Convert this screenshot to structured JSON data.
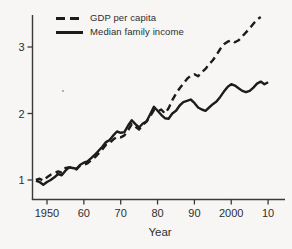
{
  "figure": {
    "background": "#f7f6f4",
    "axis_color": "#3a3a3a",
    "text_color": "#2e2e2e",
    "line_color": "#1c1c1c",
    "xlabel": "Year"
  },
  "legend": {
    "items": [
      {
        "label": "GDP per capita",
        "style": "dashed"
      },
      {
        "label": "Median family income",
        "style": "solid"
      }
    ]
  },
  "chart_data": {
    "type": "line",
    "title": "",
    "xlabel": "Year",
    "ylabel": "",
    "grid": false,
    "legend_position": "top-left",
    "ylim": [
      0.7,
      3.5
    ],
    "y_ticks": [
      1,
      2,
      3
    ],
    "y_tick_labels": [
      "1",
      "2",
      "3"
    ],
    "x_ticks": [
      1950,
      1960,
      1970,
      1980,
      1990,
      2000,
      2010
    ],
    "x_tick_labels": [
      "1950",
      "60",
      "70",
      "80",
      "90",
      "2000",
      "10"
    ],
    "series": [
      {
        "name": "GDP per capita",
        "style": "dashed",
        "points": [
          [
            1947,
            1.0
          ],
          [
            1948,
            1.02
          ],
          [
            1949,
            0.99
          ],
          [
            1950,
            1.04
          ],
          [
            1951,
            1.08
          ],
          [
            1952,
            1.1
          ],
          [
            1953,
            1.13
          ],
          [
            1954,
            1.11
          ],
          [
            1955,
            1.18
          ],
          [
            1956,
            1.19
          ],
          [
            1957,
            1.19
          ],
          [
            1958,
            1.16
          ],
          [
            1959,
            1.22
          ],
          [
            1960,
            1.23
          ],
          [
            1961,
            1.25
          ],
          [
            1962,
            1.3
          ],
          [
            1963,
            1.34
          ],
          [
            1964,
            1.4
          ],
          [
            1965,
            1.46
          ],
          [
            1966,
            1.53
          ],
          [
            1967,
            1.55
          ],
          [
            1968,
            1.61
          ],
          [
            1969,
            1.65
          ],
          [
            1970,
            1.64
          ],
          [
            1971,
            1.67
          ],
          [
            1972,
            1.75
          ],
          [
            1973,
            1.84
          ],
          [
            1974,
            1.8
          ],
          [
            1975,
            1.76
          ],
          [
            1976,
            1.83
          ],
          [
            1977,
            1.88
          ],
          [
            1978,
            1.96
          ],
          [
            1979,
            2.05
          ],
          [
            1980,
            2.03
          ],
          [
            1981,
            2.06
          ],
          [
            1982,
            2.0
          ],
          [
            1983,
            2.08
          ],
          [
            1984,
            2.2
          ],
          [
            1985,
            2.3
          ],
          [
            1986,
            2.38
          ],
          [
            1987,
            2.45
          ],
          [
            1988,
            2.52
          ],
          [
            1989,
            2.57
          ],
          [
            1990,
            2.59
          ],
          [
            1991,
            2.56
          ],
          [
            1992,
            2.62
          ],
          [
            1993,
            2.67
          ],
          [
            1994,
            2.74
          ],
          [
            1995,
            2.8
          ],
          [
            1996,
            2.88
          ],
          [
            1997,
            2.97
          ],
          [
            1998,
            3.04
          ],
          [
            1999,
            3.08
          ],
          [
            2000,
            3.1
          ],
          [
            2001,
            3.07
          ],
          [
            2002,
            3.1
          ],
          [
            2003,
            3.16
          ],
          [
            2004,
            3.22
          ],
          [
            2005,
            3.28
          ],
          [
            2006,
            3.35
          ],
          [
            2007,
            3.41
          ],
          [
            2008,
            3.45
          ]
        ]
      },
      {
        "name": "Median family income",
        "style": "solid",
        "points": [
          [
            1947,
            0.99
          ],
          [
            1948,
            0.97
          ],
          [
            1949,
            0.93
          ],
          [
            1950,
            0.97
          ],
          [
            1951,
            1.0
          ],
          [
            1952,
            1.04
          ],
          [
            1953,
            1.09
          ],
          [
            1954,
            1.07
          ],
          [
            1955,
            1.14
          ],
          [
            1956,
            1.19
          ],
          [
            1957,
            1.18
          ],
          [
            1958,
            1.17
          ],
          [
            1959,
            1.23
          ],
          [
            1960,
            1.26
          ],
          [
            1961,
            1.28
          ],
          [
            1962,
            1.33
          ],
          [
            1963,
            1.38
          ],
          [
            1964,
            1.44
          ],
          [
            1965,
            1.5
          ],
          [
            1966,
            1.57
          ],
          [
            1967,
            1.6
          ],
          [
            1968,
            1.67
          ],
          [
            1969,
            1.73
          ],
          [
            1970,
            1.71
          ],
          [
            1971,
            1.72
          ],
          [
            1972,
            1.82
          ],
          [
            1973,
            1.9
          ],
          [
            1974,
            1.84
          ],
          [
            1975,
            1.79
          ],
          [
            1976,
            1.85
          ],
          [
            1977,
            1.88
          ],
          [
            1978,
            1.99
          ],
          [
            1979,
            2.1
          ],
          [
            1980,
            2.04
          ],
          [
            1981,
            1.98
          ],
          [
            1982,
            1.93
          ],
          [
            1983,
            1.92
          ],
          [
            1984,
            2.0
          ],
          [
            1985,
            2.04
          ],
          [
            1986,
            2.12
          ],
          [
            1987,
            2.17
          ],
          [
            1988,
            2.19
          ],
          [
            1989,
            2.21
          ],
          [
            1990,
            2.16
          ],
          [
            1991,
            2.09
          ],
          [
            1992,
            2.06
          ],
          [
            1993,
            2.04
          ],
          [
            1994,
            2.09
          ],
          [
            1995,
            2.14
          ],
          [
            1996,
            2.18
          ],
          [
            1997,
            2.25
          ],
          [
            1998,
            2.33
          ],
          [
            1999,
            2.4
          ],
          [
            2000,
            2.44
          ],
          [
            2001,
            2.42
          ],
          [
            2002,
            2.38
          ],
          [
            2003,
            2.34
          ],
          [
            2004,
            2.32
          ],
          [
            2005,
            2.34
          ],
          [
            2006,
            2.39
          ],
          [
            2007,
            2.45
          ],
          [
            2008,
            2.48
          ],
          [
            2009,
            2.44
          ],
          [
            2010,
            2.47
          ]
        ]
      }
    ]
  }
}
